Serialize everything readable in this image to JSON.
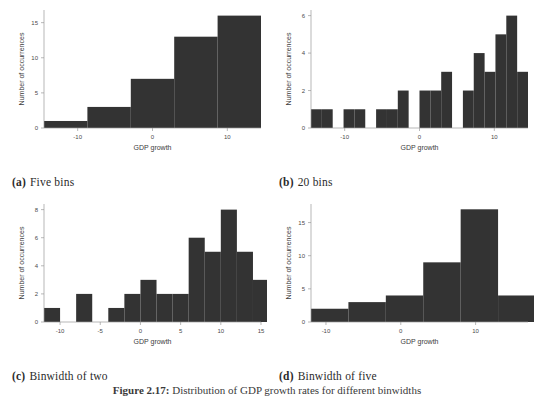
{
  "figure": {
    "footer_tag": "Figure 2.17:",
    "footer_text": "Distribution of GDP growth rates for different binwidths"
  },
  "panels": [
    {
      "id": "a",
      "cap_tag": "(a)",
      "cap_text": "Five bins",
      "chart_data": {
        "type": "bar",
        "title": "Five bins",
        "xlabel": "GDP growth",
        "ylabel": "Number of occurrences",
        "xlim": [
          -14.5,
          14.5
        ],
        "ylim": [
          0,
          16.8
        ],
        "xticks": [
          -10,
          0,
          10
        ],
        "yticks": [
          0,
          5,
          10,
          15
        ],
        "grid": false,
        "legend": "none",
        "bin_edges": [
          -14.5,
          -8.7,
          -2.9,
          2.9,
          8.7,
          14.5
        ],
        "values": [
          1,
          3,
          7,
          13,
          16
        ]
      }
    },
    {
      "id": "b",
      "cap_tag": "(b)",
      "cap_text": "20 bins",
      "chart_data": {
        "type": "bar",
        "title": "20 bins",
        "xlabel": "GDP growth",
        "ylabel": "Number of occurrences",
        "xlim": [
          -14.5,
          14.5
        ],
        "ylim": [
          0,
          6.3
        ],
        "xticks": [
          -10,
          0,
          10
        ],
        "yticks": [
          0,
          2,
          4,
          6
        ],
        "grid": false,
        "legend": "none",
        "bin_edges": [
          -14.5,
          -13.05,
          -11.6,
          -10.15,
          -8.7,
          -7.25,
          -5.8,
          -4.35,
          -2.9,
          -1.45,
          0,
          1.45,
          2.9,
          4.35,
          5.8,
          7.25,
          8.7,
          10.15,
          11.6,
          13.05,
          14.5
        ],
        "values": [
          1,
          1,
          0,
          1,
          1,
          0,
          1,
          1,
          2,
          0,
          2,
          2,
          3,
          0,
          2,
          4,
          3,
          5,
          6,
          3,
          3,
          1
        ]
      }
    },
    {
      "id": "c",
      "cap_tag": "(c)",
      "cap_text": "Binwidth of two",
      "chart_data": {
        "type": "bar",
        "title": "Binwidth of two",
        "xlabel": "GDP growth",
        "ylabel": "Number of occurrences",
        "xlim": [
          -12,
          15
        ],
        "ylim": [
          0,
          8.4
        ],
        "xticks": [
          -10,
          -5,
          0,
          5,
          10,
          15
        ],
        "yticks": [
          0,
          2,
          4,
          6,
          8
        ],
        "grid": false,
        "legend": "none",
        "binwidth": 2,
        "bin_starts": [
          -12,
          -10,
          -8,
          -6,
          -4,
          -2,
          0,
          2,
          4,
          6,
          8,
          10,
          12
        ],
        "values": [
          1,
          0,
          2,
          0,
          1,
          2,
          3,
          2,
          2,
          6,
          5,
          8,
          5,
          3
        ]
      }
    },
    {
      "id": "d",
      "cap_tag": "(d)",
      "cap_text": "Binwidth of five",
      "chart_data": {
        "type": "bar",
        "title": "Binwidth of five",
        "xlabel": "GDP growth",
        "ylabel": "Number of occurrences",
        "xlim": [
          -12,
          17
        ],
        "ylim": [
          0,
          17.8
        ],
        "xticks": [
          -10,
          0,
          10
        ],
        "yticks": [
          0,
          5,
          10,
          15
        ],
        "grid": false,
        "legend": "none",
        "binwidth": 5,
        "bin_starts": [
          -12,
          -7,
          -2,
          3,
          8,
          13
        ],
        "values": [
          2,
          3,
          4,
          9,
          17,
          4
        ]
      }
    }
  ]
}
